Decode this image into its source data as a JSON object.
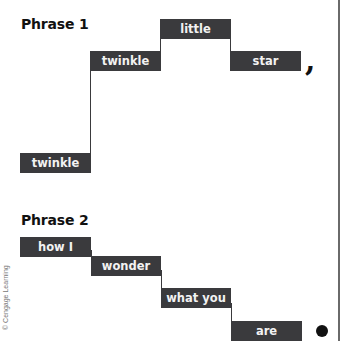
{
  "phrase1": {
    "title": "Phrase 1",
    "words": [
      "twinkle",
      "twinkle",
      "little",
      "star"
    ],
    "end_punctuation": ","
  },
  "phrase2": {
    "title": "Phrase 2",
    "words": [
      "how I",
      "wonder",
      "what you",
      "are"
    ],
    "end_punctuation": "."
  },
  "colors": {
    "box": "#3a3a3d",
    "box_text": "#f2f2f2",
    "title": "#111111",
    "border": "#6a6a6a"
  },
  "credit": "© Cengage Learning"
}
